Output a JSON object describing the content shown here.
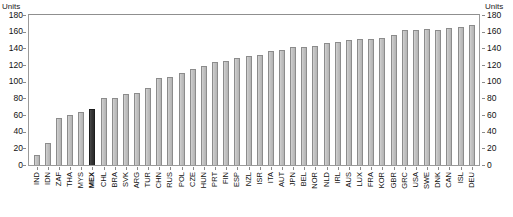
{
  "axis": {
    "units_left": "Units",
    "units_right": "Units",
    "y_ticks": [
      180,
      160,
      140,
      120,
      100,
      80,
      60,
      40,
      20,
      0
    ]
  },
  "top_crop_text": "",
  "chart_data": {
    "type": "bar",
    "title": "",
    "xlabel": "",
    "ylabel": "Units",
    "ylim": [
      0,
      180
    ],
    "grid": false,
    "legend": "none",
    "y_tick_step": 20,
    "highlight_category": "MEX",
    "highlight_color": "#2b2b2b",
    "bar_color": "#c2c2c2",
    "categories": [
      "IND",
      "IDN",
      "ZAF",
      "THA",
      "MYS",
      "MEX",
      "CHL",
      "BRA",
      "SVK",
      "ARG",
      "TUR",
      "CHN",
      "RUS",
      "POL",
      "CZE",
      "HUN",
      "PRT",
      "FIN",
      "ESP",
      "NZL",
      "ISR",
      "ITA",
      "AUT",
      "JPN",
      "BEL",
      "NOR",
      "NLD",
      "IRL",
      "AUS",
      "LUX",
      "FRA",
      "KOR",
      "GBR",
      "GRC",
      "USA",
      "SWE",
      "DNK",
      "CAN",
      "ISL",
      "DEU"
    ],
    "values": [
      12,
      27,
      56,
      60,
      64,
      67,
      80,
      81,
      85,
      86,
      92,
      105,
      106,
      110,
      115,
      119,
      124,
      125,
      128,
      131,
      132,
      137,
      138,
      142,
      142,
      143,
      146,
      148,
      150,
      151,
      151,
      152,
      156,
      162,
      162,
      163,
      162,
      164,
      166,
      168
    ]
  }
}
